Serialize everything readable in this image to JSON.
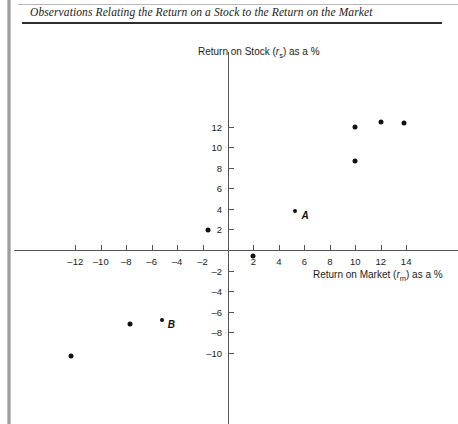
{
  "document": {
    "title": "Observations Relating the Return on a Stock to the Return on the Market"
  },
  "chart_data": {
    "type": "scatter",
    "title": "Observations Relating the Return on a Stock to the Return on the Market",
    "xlabel": "Return on Market (rm) as a %",
    "ylabel": "Return on Stock (rs) as a %",
    "xlabel_parts": {
      "pre": "Return on Market (",
      "sym": "r",
      "sub": "m",
      "post": ") as a %"
    },
    "ylabel_parts": {
      "pre": "Return on Stock (",
      "sym": "r",
      "sub": "s",
      "post": ") as a %"
    },
    "xlim": [
      -14,
      15
    ],
    "ylim": [
      -11.5,
      13.5
    ],
    "xticks": [
      -12,
      -10,
      -8,
      -6,
      -4,
      -2,
      2,
      4,
      6,
      8,
      10,
      12,
      14
    ],
    "yticks": [
      -10,
      -8,
      -6,
      -4,
      -2,
      2,
      4,
      6,
      8,
      10,
      12
    ],
    "xticklabels": [
      "–12",
      "–10",
      "–8",
      "–6",
      "–4",
      "–2",
      "2",
      "4",
      "6",
      "8",
      "10",
      "12",
      "14"
    ],
    "yticklabels": [
      "–10",
      "–8",
      "–6",
      "–4",
      "–2",
      "2",
      "4",
      "6",
      "8",
      "10",
      "12"
    ],
    "grid": false,
    "legend": null,
    "marker_color": "#111111",
    "axis_color": "#555555",
    "points": [
      {
        "x": -12.3,
        "y": -10.3,
        "label": ""
      },
      {
        "x": -7.7,
        "y": -7.2,
        "label": ""
      },
      {
        "x": -5.2,
        "y": -6.8,
        "label": "B"
      },
      {
        "x": -1.6,
        "y": 1.9,
        "label": ""
      },
      {
        "x": 2.0,
        "y": -0.6,
        "label": ""
      },
      {
        "x": 5.3,
        "y": 3.8,
        "label": "A"
      },
      {
        "x": 10.0,
        "y": 8.7,
        "label": ""
      },
      {
        "x": 10.0,
        "y": 12.0,
        "label": ""
      },
      {
        "x": 12.0,
        "y": 12.5,
        "label": ""
      },
      {
        "x": 13.8,
        "y": 12.4,
        "label": ""
      }
    ],
    "annotations": [
      {
        "text": "A",
        "x": 5.3,
        "y": 3.8
      },
      {
        "text": "B",
        "x": -5.2,
        "y": -6.8
      }
    ]
  }
}
